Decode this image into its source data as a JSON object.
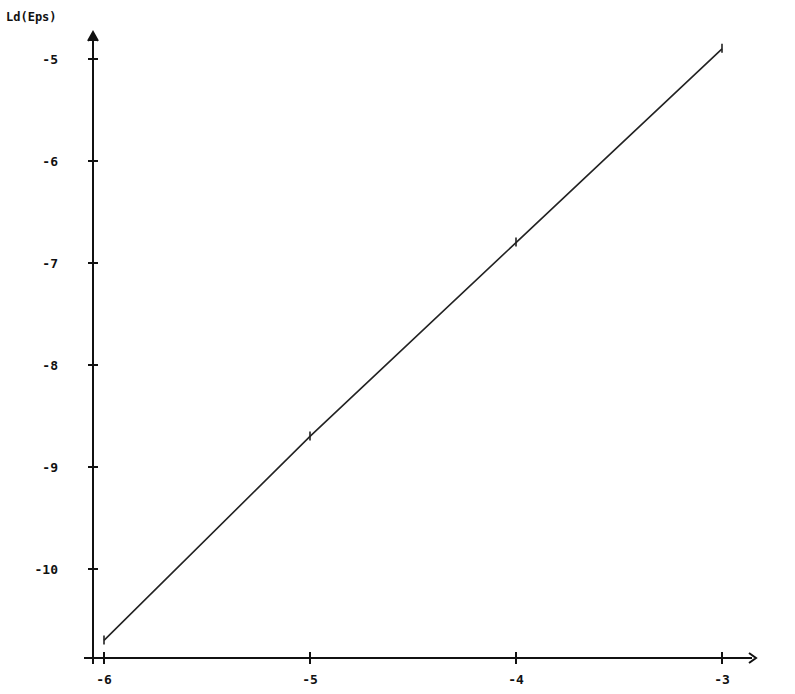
{
  "chart_data": {
    "type": "line",
    "title": "",
    "xlabel": "",
    "ylabel": "Ld(Eps)",
    "xlim": [
      -6,
      -3
    ],
    "ylim": [
      -10.85,
      -4.85
    ],
    "grid": false,
    "legend": null,
    "x_ticks": [
      -6,
      -5,
      -4,
      -3
    ],
    "x_tick_labels": [
      "-6",
      "-5",
      "-4",
      "-3"
    ],
    "y_ticks": [
      -5,
      -6,
      -7,
      -8,
      -9,
      -10
    ],
    "y_tick_labels": [
      "-5",
      "-6",
      "-7",
      "-8",
      "-9",
      "-10"
    ],
    "series": [
      {
        "name": "Ld(Eps)",
        "x": [
          -6,
          -5,
          -4,
          -3
        ],
        "values": [
          -10.7,
          -8.7,
          -6.8,
          -4.9
        ],
        "color": "#222222",
        "markers": "small tick marks at each point"
      }
    ]
  }
}
